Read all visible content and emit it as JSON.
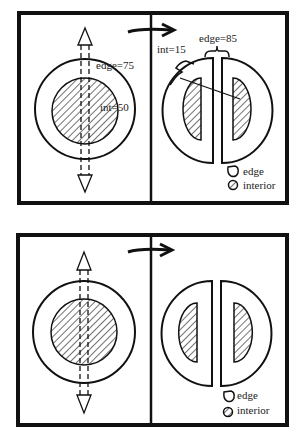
{
  "figure": {
    "panels": [
      {
        "id": "top",
        "before": {
          "edge_label": "edge=75",
          "interior_label": "int=50"
        },
        "after": {
          "edge_label": "edge=85",
          "interior_label": "int=15"
        },
        "legend": {
          "edge": "edge",
          "interior": "interior"
        }
      },
      {
        "id": "bottom",
        "before": {
          "edge_label": "",
          "interior_label": ""
        },
        "after": {
          "edge_label": "",
          "interior_label": ""
        },
        "legend": {
          "edge": "edge",
          "interior": "interior"
        }
      }
    ],
    "colors": {
      "ink": "#111111",
      "paper": "#ffffff"
    }
  }
}
